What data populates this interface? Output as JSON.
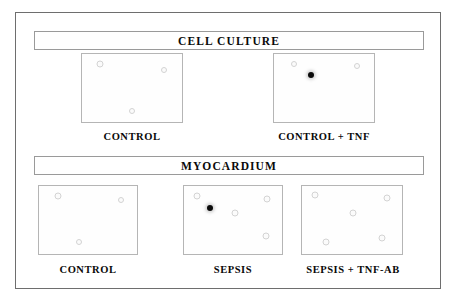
{
  "figure": {
    "sections": [
      {
        "id": "cell-culture",
        "banner_label": "CELL CULTURE",
        "panels": [
          {
            "id": "cell-culture-control",
            "caption": "CONTROL",
            "spots": [
              {
                "kind": "faint",
                "x_pct": 18,
                "y_pct": 14,
                "size": 5
              },
              {
                "kind": "faint",
                "x_pct": 82,
                "y_pct": 23,
                "size": 4
              },
              {
                "kind": "faint",
                "x_pct": 50,
                "y_pct": 84,
                "size": 4
              }
            ]
          },
          {
            "id": "cell-culture-control-tnf",
            "caption": "CONTROL + TNF",
            "spots": [
              {
                "kind": "faint",
                "x_pct": 20,
                "y_pct": 15,
                "size": 4
              },
              {
                "kind": "faint",
                "x_pct": 83,
                "y_pct": 17,
                "size": 4
              },
              {
                "kind": "dark",
                "x_pct": 37,
                "y_pct": 31,
                "size": 6
              }
            ]
          }
        ]
      },
      {
        "id": "myocardium",
        "banner_label": "MYOCARDIUM",
        "panels": [
          {
            "id": "myocardium-control",
            "caption": "CONTROL",
            "spots": [
              {
                "kind": "faint",
                "x_pct": 19,
                "y_pct": 15,
                "size": 5
              },
              {
                "kind": "faint",
                "x_pct": 84,
                "y_pct": 21,
                "size": 4
              },
              {
                "kind": "faint",
                "x_pct": 41,
                "y_pct": 82,
                "size": 4
              }
            ]
          },
          {
            "id": "myocardium-sepsis",
            "caption": "SEPSIS",
            "spots": [
              {
                "kind": "faint",
                "x_pct": 13,
                "y_pct": 14,
                "size": 5
              },
              {
                "kind": "faint",
                "x_pct": 85,
                "y_pct": 19,
                "size": 5
              },
              {
                "kind": "dark",
                "x_pct": 27,
                "y_pct": 32,
                "size": 6
              },
              {
                "kind": "faint",
                "x_pct": 52,
                "y_pct": 40,
                "size": 5
              },
              {
                "kind": "faint",
                "x_pct": 84,
                "y_pct": 73,
                "size": 5
              }
            ]
          },
          {
            "id": "myocardium-sepsis-tnf-ab",
            "caption": "SEPSIS + TNF-AB",
            "spots": [
              {
                "kind": "faint",
                "x_pct": 13,
                "y_pct": 13,
                "size": 5
              },
              {
                "kind": "faint",
                "x_pct": 85,
                "y_pct": 18,
                "size": 5
              },
              {
                "kind": "faint",
                "x_pct": 51,
                "y_pct": 40,
                "size": 5
              },
              {
                "kind": "faint",
                "x_pct": 24,
                "y_pct": 83,
                "size": 5
              },
              {
                "kind": "faint",
                "x_pct": 80,
                "y_pct": 76,
                "size": 5
              }
            ]
          }
        ]
      }
    ]
  },
  "colors": {
    "frame_border": "#6e6e6e",
    "banner_border": "#9a9a9a",
    "panel_border": "#b5b5b5",
    "spot_dark": "#0a0a0a",
    "spot_faint": "#d3d3d3",
    "background": "#ffffff",
    "text": "#0a0a0a"
  },
  "geometry": {
    "panels": [
      {
        "id": "cell-culture-control",
        "left": 80,
        "top": 52,
        "width": 102,
        "height": 70,
        "caption_left": 62,
        "caption_top": 130,
        "caption_width": 138
      },
      {
        "id": "cell-culture-control-tnf",
        "left": 272,
        "top": 52,
        "width": 102,
        "height": 70,
        "caption_left": 254,
        "caption_top": 130,
        "caption_width": 138
      },
      {
        "id": "myocardium-control",
        "left": 37,
        "top": 184,
        "width": 100,
        "height": 70,
        "caption_left": 22,
        "caption_top": 263,
        "caption_width": 130
      },
      {
        "id": "myocardium-sepsis",
        "left": 182,
        "top": 184,
        "width": 100,
        "height": 70,
        "caption_left": 167,
        "caption_top": 263,
        "caption_width": 130
      },
      {
        "id": "myocardium-sepsis-tnf-ab",
        "left": 300,
        "top": 184,
        "width": 102,
        "height": 70,
        "caption_left": 288,
        "caption_top": 263,
        "caption_width": 128
      }
    ]
  }
}
